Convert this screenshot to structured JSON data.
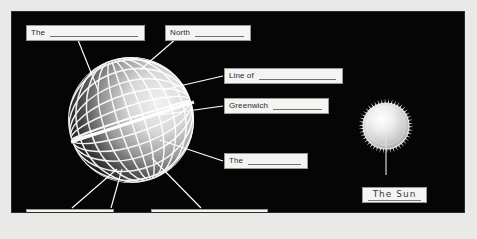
{
  "figure": {
    "panel_background": "#050505",
    "page_background": "#e9e9e7",
    "label_background": "#f4f4f2",
    "label_border": "#9a9a96",
    "label_text_color": "#2a2a2a",
    "line_color": "#ffffff"
  },
  "labels": [
    {
      "id": "top-left",
      "text": "The",
      "blank": true,
      "x": 14,
      "y": 13,
      "w": 119,
      "h": 16
    },
    {
      "id": "north",
      "text": "North",
      "blank": true,
      "x": 153,
      "y": 13,
      "w": 86,
      "h": 16
    },
    {
      "id": "line-of-upper",
      "text": "Line of",
      "blank": true,
      "x": 212,
      "y": 56,
      "w": 119,
      "h": 16
    },
    {
      "id": "greenwich",
      "text": "Greenwich",
      "blank": true,
      "x": 212,
      "y": 86,
      "w": 105,
      "h": 16
    },
    {
      "id": "the-middle",
      "text": "The",
      "blank": true,
      "x": 212,
      "y": 141,
      "w": 84,
      "h": 16
    },
    {
      "id": "south",
      "text": "South",
      "blank": true,
      "x": 14,
      "y": 197,
      "w": 88,
      "h": 16
    },
    {
      "id": "line-of-lower",
      "text": "Line of",
      "blank": true,
      "x": 139,
      "y": 197,
      "w": 117,
      "h": 16
    },
    {
      "id": "the-sun",
      "text": "The Sun",
      "blank": false,
      "x": 350,
      "y": 175,
      "w": 65,
      "h": 16
    }
  ],
  "objects": {
    "globe": {
      "name": "Earth globe wireframe",
      "cx": 130,
      "cy": 119,
      "r": 63
    },
    "sun": {
      "name": "Sun with corona",
      "cx": 385,
      "cy": 125,
      "r": 26
    }
  }
}
